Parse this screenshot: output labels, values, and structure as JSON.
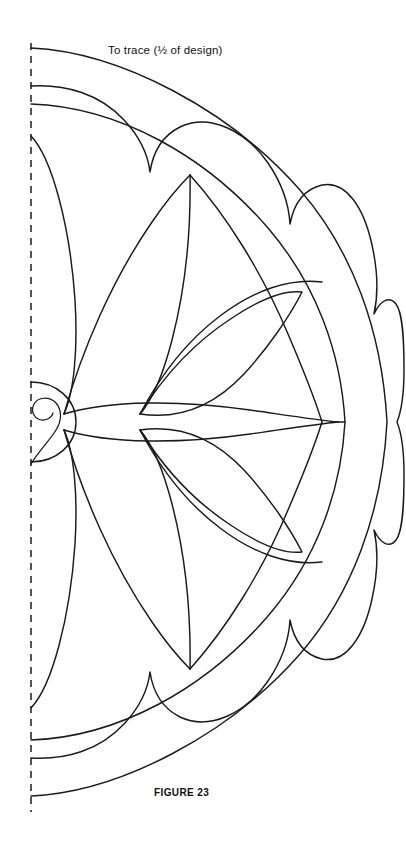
{
  "page": {
    "width": 406,
    "height": 855,
    "background_color": "#ffffff",
    "ink_color": "#1a1a1a"
  },
  "annotations": {
    "trace_note": "To trace (½ of design)",
    "figure_caption": "FIGURE 23"
  },
  "fold_line": {
    "name": "center-fold-dashed-line",
    "orientation": "vertical",
    "x": 31,
    "y_start": 43,
    "y_end": 812,
    "dash_pattern": "7 6"
  },
  "design": {
    "title": "Half medallion quilting design",
    "symmetry": "mirrored about horizontal center line",
    "center_x": 31,
    "center_y": 422,
    "outer_radius_x": 388,
    "medallion": {
      "outer_half_circle_radius": 40,
      "inner_spiral": true
    },
    "border_bands": [
      {
        "name": "outer-rim-arc"
      },
      {
        "name": "scalloped-band"
      },
      {
        "name": "inner-ring-arc"
      }
    ],
    "petal_count_per_half": 4,
    "leaf_count_per_half": 2
  }
}
